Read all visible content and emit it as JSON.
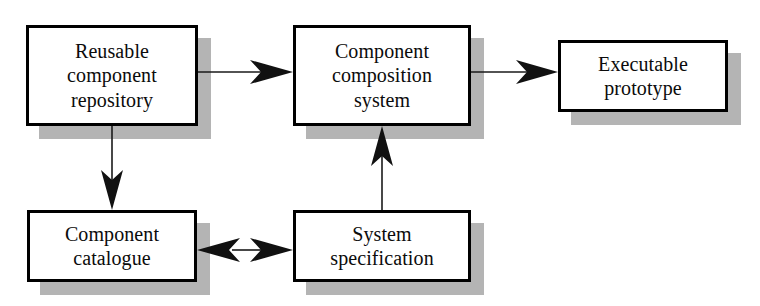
{
  "diagram": {
    "type": "flow-diagram",
    "background_color": "#ffffff",
    "border_color": "#000000",
    "shadow_color": "#b4b4b4",
    "line_color": "#1a1a1a",
    "nodes": [
      {
        "id": "reusable-component-repository",
        "label": "Reusable\ncomponent\nrepository",
        "x": 26,
        "y": 25,
        "w": 172,
        "h": 101
      },
      {
        "id": "component-composition-system",
        "label": "Component\ncomposition\nsystem",
        "x": 293,
        "y": 25,
        "w": 178,
        "h": 101
      },
      {
        "id": "executable-prototype",
        "label": "Executable\nprototype",
        "x": 558,
        "y": 40,
        "w": 170,
        "h": 72
      },
      {
        "id": "component-catalogue",
        "label": "Component\ncatalogue",
        "x": 27,
        "y": 210,
        "w": 170,
        "h": 72
      },
      {
        "id": "system-specification",
        "label": "System\nspecification",
        "x": 293,
        "y": 210,
        "w": 178,
        "h": 72
      }
    ],
    "edges": [
      {
        "id": "repository-to-composition",
        "from": "reusable-component-repository",
        "to": "component-composition-system",
        "direction": "right",
        "arrowheads": 1
      },
      {
        "id": "composition-to-prototype",
        "from": "component-composition-system",
        "to": "executable-prototype",
        "direction": "right",
        "arrowheads": 1
      },
      {
        "id": "repository-to-catalogue",
        "from": "reusable-component-repository",
        "to": "component-catalogue",
        "direction": "down",
        "arrowheads": 1
      },
      {
        "id": "specification-to-composition",
        "from": "system-specification",
        "to": "component-composition-system",
        "direction": "up",
        "arrowheads": 1
      },
      {
        "id": "catalogue-specification-bidirectional",
        "from": "component-catalogue",
        "to": "system-specification",
        "direction": "both",
        "arrowheads": 2
      }
    ]
  }
}
